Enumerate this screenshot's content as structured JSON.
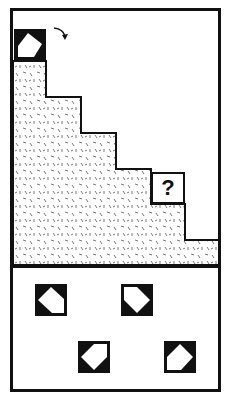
{
  "puzzle": {
    "question_mark": "?",
    "rotation_arrow": "clockwise-arrow",
    "colors": {
      "ink": "#111111",
      "paper": "#ffffff",
      "stipple": "#555555"
    },
    "staircase_steps": 6,
    "options": [
      {
        "id": "option-1",
        "shape": "tile-variant-a"
      },
      {
        "id": "option-2",
        "shape": "tile-variant-b"
      },
      {
        "id": "option-3",
        "shape": "tile-variant-c"
      },
      {
        "id": "option-4",
        "shape": "tile-variant-d"
      }
    ]
  }
}
